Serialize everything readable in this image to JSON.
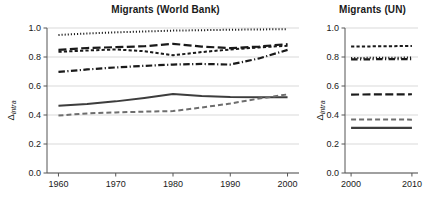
{
  "figure": {
    "background": "#ffffff",
    "axis_color": "#555555",
    "grid_color": "#d9d9d9"
  },
  "chart_data": [
    {
      "type": "line",
      "title": "Migrants (World Bank)",
      "xlabel": "",
      "ylabel": "Δintra",
      "ylabel_base": "Δ",
      "ylabel_sub": "intra",
      "xlim": [
        1958,
        2002
      ],
      "ylim": [
        0.0,
        1.0
      ],
      "grid": true,
      "grid_axis": "y",
      "legend": "none",
      "xticks": [
        1960,
        1970,
        1980,
        1990,
        2000
      ],
      "xticklabels": [
        "1960",
        "1970",
        "1980",
        "1990",
        "2000"
      ],
      "yticks": [
        0.0,
        0.2,
        0.4,
        0.6,
        0.8,
        1.0
      ],
      "yticklabels": [
        "0.0",
        "0.2",
        "0.4",
        "0.6",
        "0.8",
        "1.0"
      ],
      "x": [
        1960,
        1965,
        1970,
        1975,
        1980,
        1985,
        1990,
        1995,
        2000
      ],
      "series": [
        {
          "name": "dotted-series",
          "style": "dotted",
          "color": "#1a1a1a",
          "width": 2.0,
          "values": [
            0.952,
            0.962,
            0.97,
            0.976,
            0.982,
            0.985,
            0.988,
            0.99,
            0.992
          ]
        },
        {
          "name": "long-dash-series",
          "style": "long-dash",
          "color": "#1a1a1a",
          "width": 2.2,
          "values": [
            0.849,
            0.862,
            0.868,
            0.874,
            0.891,
            0.872,
            0.861,
            0.872,
            0.889
          ]
        },
        {
          "name": "short-dash-series",
          "style": "short-dash",
          "color": "#1a1a1a",
          "width": 2.0,
          "values": [
            0.836,
            0.845,
            0.852,
            0.84,
            0.812,
            0.834,
            0.852,
            0.866,
            0.878
          ]
        },
        {
          "name": "dash-dot-series",
          "style": "dash-dot",
          "color": "#1a1a1a",
          "width": 2.2,
          "values": [
            0.697,
            0.714,
            0.728,
            0.739,
            0.748,
            0.752,
            0.748,
            0.79,
            0.849
          ]
        },
        {
          "name": "solid-dark-series",
          "style": "solid",
          "color": "#3d3d3d",
          "width": 2.0,
          "values": [
            0.463,
            0.476,
            0.494,
            0.518,
            0.545,
            0.531,
            0.524,
            0.523,
            0.523
          ]
        },
        {
          "name": "gray-dash-series",
          "style": "medium-dash",
          "color": "#6e6e6e",
          "width": 2.0,
          "values": [
            0.396,
            0.411,
            0.418,
            0.423,
            0.427,
            0.452,
            0.479,
            0.513,
            0.542
          ]
        }
      ]
    },
    {
      "type": "line",
      "title": "Migrants (UN)",
      "xlabel": "",
      "ylabel": "Δintra",
      "ylabel_base": "Δ",
      "ylabel_sub": "intra",
      "xlim": [
        1999,
        2011
      ],
      "ylim": [
        0.0,
        1.0
      ],
      "grid": true,
      "grid_axis": "y",
      "legend": "none",
      "xticks": [
        2000,
        2010
      ],
      "xticklabels": [
        "2000",
        "2010"
      ],
      "yticks": [
        0.0,
        0.2,
        0.4,
        0.6,
        0.8,
        1.0
      ],
      "yticklabels": [
        "0.0",
        "0.2",
        "0.4",
        "0.6",
        "0.8",
        "1.0"
      ],
      "x": [
        2000,
        2005,
        2010
      ],
      "series": [
        {
          "name": "short-dash-series",
          "style": "short-dash",
          "color": "#1a1a1a",
          "width": 2.0,
          "values": [
            0.872,
            0.874,
            0.876
          ]
        },
        {
          "name": "dotted-series",
          "style": "dotted",
          "color": "#1a1a1a",
          "width": 2.0,
          "values": [
            0.793,
            0.795,
            0.796
          ]
        },
        {
          "name": "dash-dot-series",
          "style": "dash-dot",
          "color": "#1a1a1a",
          "width": 2.2,
          "values": [
            0.783,
            0.785,
            0.786
          ]
        },
        {
          "name": "long-dash-series",
          "style": "long-dash",
          "color": "#1a1a1a",
          "width": 2.2,
          "values": [
            0.541,
            0.542,
            0.543
          ]
        },
        {
          "name": "gray-dash-series",
          "style": "medium-dash",
          "color": "#6e6e6e",
          "width": 2.0,
          "values": [
            0.369,
            0.369,
            0.368
          ]
        },
        {
          "name": "solid-dark-series",
          "style": "solid",
          "color": "#3d3d3d",
          "width": 2.2,
          "values": [
            0.311,
            0.311,
            0.311
          ]
        }
      ]
    }
  ]
}
